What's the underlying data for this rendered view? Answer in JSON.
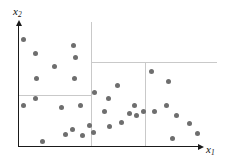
{
  "chart_data": {
    "type": "scatter",
    "title": "",
    "xlabel": "x1",
    "ylabel": "x2",
    "xlabel_display": "x",
    "xlabel_sub": "1",
    "ylabel_display": "x",
    "ylabel_sub": "2",
    "grid": false,
    "legend": null,
    "axis_style": "arrow-terminated L-shaped axes, no tick marks, no tick labels",
    "xlim": [
      0,
      100
    ],
    "ylim": [
      0,
      100
    ],
    "point_color": "#6e6e6e",
    "axis_color": "#1a1a1a",
    "split_color": "#c9c9c9",
    "points": [
      {
        "x": 3.0,
        "y": 88.5
      },
      {
        "x": 9.6,
        "y": 77.0
      },
      {
        "x": 20.4,
        "y": 66.0
      },
      {
        "x": 31.0,
        "y": 84.0
      },
      {
        "x": 32.2,
        "y": 73.5
      },
      {
        "x": 10.2,
        "y": 56.5
      },
      {
        "x": 31.6,
        "y": 56.0
      },
      {
        "x": 2.9,
        "y": 33.5
      },
      {
        "x": 9.6,
        "y": 40.0
      },
      {
        "x": 42.5,
        "y": 45.0
      },
      {
        "x": 34.5,
        "y": 33.5
      },
      {
        "x": 50.0,
        "y": 39.5
      },
      {
        "x": 55.2,
        "y": 50.5
      },
      {
        "x": 74.0,
        "y": 62.0
      },
      {
        "x": 83.5,
        "y": 54.0
      },
      {
        "x": 48.0,
        "y": 29.0
      },
      {
        "x": 62.0,
        "y": 27.5
      },
      {
        "x": 39.5,
        "y": 17.0
      },
      {
        "x": 30.0,
        "y": 13.5
      },
      {
        "x": 51.0,
        "y": 16.5
      },
      {
        "x": 57.5,
        "y": 19.5
      },
      {
        "x": 66.0,
        "y": 25.5
      },
      {
        "x": 76.0,
        "y": 29.0
      },
      {
        "x": 69.5,
        "y": 29.0
      },
      {
        "x": 88.0,
        "y": 25.5
      },
      {
        "x": 95.0,
        "y": 19.0
      },
      {
        "x": 99.5,
        "y": 10.5
      },
      {
        "x": 86.0,
        "y": 6.5
      },
      {
        "x": 13.8,
        "y": 4.0
      },
      {
        "x": 26.5,
        "y": 10.0
      },
      {
        "x": 36.0,
        "y": 9.0
      },
      {
        "x": 42.0,
        "y": 11.0
      },
      {
        "x": 82.5,
        "y": 34.0
      },
      {
        "x": 64.5,
        "y": 34.0
      },
      {
        "x": 24.0,
        "y": 32.0
      }
    ],
    "partition_lines": [
      {
        "id": "split-vertical-left",
        "orientation": "vertical",
        "x": 40.0,
        "y_from": 0.0,
        "y_to": 100.0
      },
      {
        "id": "split-horizontal-top",
        "orientation": "horizontal",
        "y": 62.0,
        "x_from": 40.0,
        "x_to": 100.0
      },
      {
        "id": "split-horizontal-mid",
        "orientation": "horizontal",
        "y": 37.5,
        "x_from": 0.0,
        "x_to": 40.0
      },
      {
        "id": "split-vertical-right",
        "orientation": "vertical",
        "x": 67.0,
        "y_from": 0.0,
        "y_to": 62.0
      }
    ]
  }
}
